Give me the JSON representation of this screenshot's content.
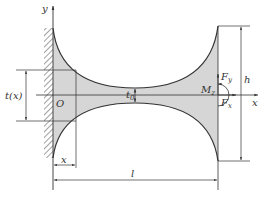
{
  "diagram": {
    "type": "cantilever beam with parabolic/circular variable thickness",
    "labels": {
      "y_axis": "y",
      "x_axis": "x",
      "origin": "O",
      "thickness_fn": "t(x)",
      "min_thickness": "t",
      "min_thickness_sub": "0",
      "moment": "M",
      "moment_sub": "z",
      "force_y": "F",
      "force_y_sub": "y",
      "force_x": "F",
      "force_x_sub": "x",
      "height": "h",
      "length": "l",
      "x_dim": "x"
    },
    "colors": {
      "fill": "#d6d6d6",
      "line": "#333333",
      "background": "#ffffff"
    }
  }
}
